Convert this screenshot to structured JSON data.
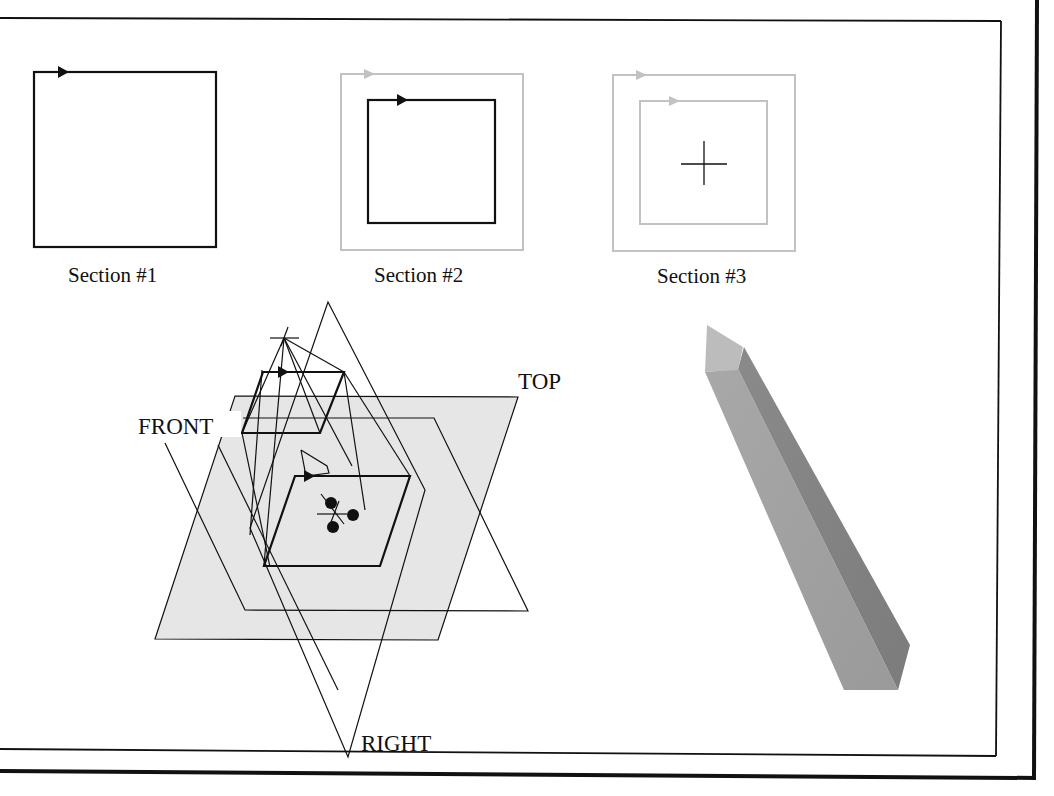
{
  "figure": {
    "colors": {
      "ink": "#111111",
      "inactive_section": "#bdbdbd",
      "plane_fill": "#e4e4e4",
      "solid_light": "#b5b5b5",
      "solid_mid": "#8f8f8f",
      "solid_dark": "#7d7d7d"
    }
  },
  "sections": [
    {
      "label": "Section #1",
      "state": "active"
    },
    {
      "label": "Section #2",
      "state": "active-inner",
      "outer_state": "inactive"
    },
    {
      "label": "Section #3",
      "state": "inactive",
      "has_center_cross": true
    }
  ],
  "planes": {
    "top": "TOP",
    "front": "FRONT",
    "right": "RIGHT"
  },
  "solid_preview": {
    "shape": "tapered square prism (blend result)",
    "description": "shaded 3D preview"
  },
  "icons": {
    "start_arrow": "start-point-arrow-icon",
    "csys_cross": "coordinate-system-cross-icon",
    "default_csys": "default-csys-icon"
  }
}
